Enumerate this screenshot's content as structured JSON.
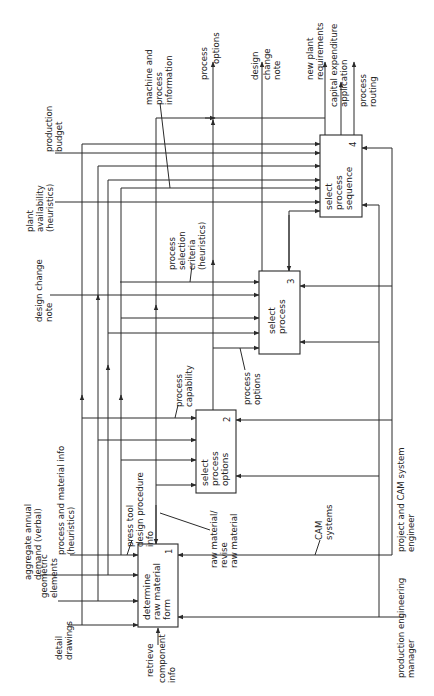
{
  "diagram": {
    "type": "IDEF0 activity diagram (rotated 90°)",
    "activities": [
      {
        "id": "1",
        "label_lines": [
          "determine",
          "raw material",
          "form"
        ]
      },
      {
        "id": "2",
        "label_lines": [
          "select",
          "process",
          "options"
        ]
      },
      {
        "id": "3",
        "label_lines": [
          "select",
          "process"
        ]
      },
      {
        "id": "4",
        "label_lines": [
          "select",
          "process",
          "sequence"
        ]
      }
    ],
    "inputs": {
      "detail_drawings": [
        "detail",
        "drawings"
      ],
      "geometric_elements": [
        "geometric",
        "elements"
      ],
      "aggregate_demand": [
        "aggregate annual",
        "demand (verbal)"
      ],
      "process_material_info": [
        "process and material info",
        "(heuristics)"
      ],
      "design_change_note_in": [
        "design change",
        "note"
      ],
      "plant_availability": [
        "plant",
        "availability",
        "(heuristics)"
      ],
      "production_budget": [
        "production",
        "budget"
      ]
    },
    "internal": {
      "press_tool": [
        "press tool",
        "design procedure",
        "info"
      ],
      "raw_material": [
        "raw material/",
        "revise",
        "raw material"
      ],
      "process_capability": [
        "process",
        "capability"
      ],
      "process_options_mid": [
        "process",
        "options"
      ],
      "selection_criteria": [
        "process",
        "selection",
        "criteria",
        "(heuristics)"
      ],
      "machine_info": [
        "machine and",
        "process",
        "information"
      ]
    },
    "outputs": {
      "process_options": [
        "process",
        "options"
      ],
      "design_change_note": [
        "design",
        "change",
        "note"
      ],
      "new_plant": [
        "new plant",
        "requirements"
      ],
      "capex": [
        "capital expenditure",
        "application"
      ],
      "routing": [
        "process",
        "routing"
      ]
    },
    "mechanisms": {
      "cam": [
        "CAM",
        "systems"
      ],
      "project_engineer": [
        "project and CAM system",
        "engineer"
      ],
      "pe_manager": [
        "production engineering",
        "manager"
      ]
    },
    "controls": {
      "retrieve": [
        "retrieve",
        "component",
        "info"
      ]
    }
  }
}
